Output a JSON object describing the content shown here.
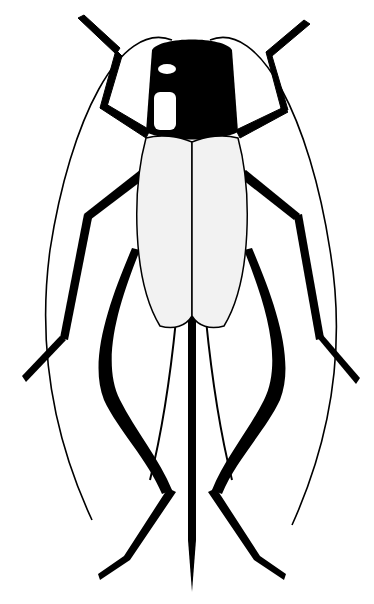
{
  "image": {
    "subject": "cricket illustration",
    "style": "black and white line drawing",
    "background_color": "#ffffff",
    "ink_color": "#000000",
    "wing_color": "#f2f2f2"
  }
}
